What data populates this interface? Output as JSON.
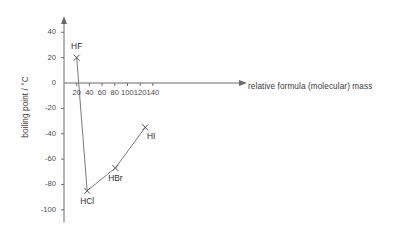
{
  "chart_data": {
    "type": "line",
    "title": "",
    "xlabel": "relative formula (molecular) mass",
    "ylabel": "boiling point / °C",
    "xlim": [
      0,
      150
    ],
    "ylim": [
      -110,
      48
    ],
    "grid": false,
    "legend": "none",
    "marker": "x",
    "xticks": [
      20,
      40,
      60,
      80,
      100,
      120,
      140
    ],
    "xticklabels": [
      "20",
      "40",
      "60",
      "80",
      "100",
      "120",
      "140"
    ],
    "yticks": [
      40,
      20,
      0,
      -20,
      -40,
      -60,
      -80,
      -100
    ],
    "yticklabels": [
      "40",
      "20",
      "0",
      "-20",
      "-40",
      "-60",
      "-80",
      "-100"
    ],
    "series": [
      {
        "name": "hydrogen halides",
        "points": [
          {
            "label": "HF",
            "x": 20,
            "y": 20
          },
          {
            "label": "HCl",
            "x": 36.5,
            "y": -85
          },
          {
            "label": "HBr",
            "x": 81,
            "y": -67
          },
          {
            "label": "HI",
            "x": 128,
            "y": -35
          }
        ]
      }
    ],
    "annotations": [
      {
        "text": "HF",
        "x": 20,
        "y": 20,
        "position": "above"
      },
      {
        "text": "HCl",
        "x": 36.5,
        "y": -85,
        "position": "below"
      },
      {
        "text": "HBr",
        "x": 81,
        "y": -67,
        "position": "below"
      },
      {
        "text": "HI",
        "x": 128,
        "y": -35,
        "position": "below-right"
      }
    ],
    "colors": {
      "axis": "#6b6b6b",
      "line": "#7a7a7a",
      "marker": "#555555",
      "text": "#3a3a3a",
      "background": "#ffffff"
    }
  }
}
